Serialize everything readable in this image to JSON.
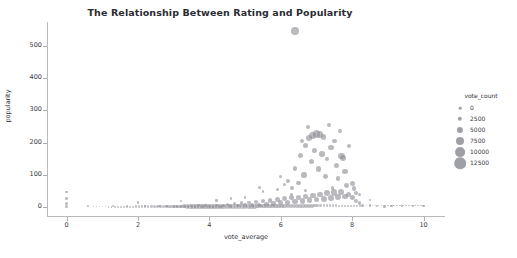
{
  "chart_data": {
    "type": "scatter",
    "title": "The Relationship Between Rating and Popularity",
    "xlabel": "vote_average",
    "ylabel": "popularity",
    "xlim": [
      -0.55,
      10.6
    ],
    "ylim": [
      -28,
      575
    ],
    "xticks": [
      0,
      2,
      4,
      6,
      8,
      10
    ],
    "yticks": [
      0,
      100,
      200,
      300,
      400,
      500
    ],
    "grid": false,
    "marker_color": "#8e8e96",
    "marker_opacity": 0.62,
    "size_legend": {
      "title": "vote_count",
      "position": "right",
      "entries": [
        {
          "label": "0",
          "value": 0,
          "px": 2.6
        },
        {
          "label": "2500",
          "value": 2500,
          "px": 4.4
        },
        {
          "label": "5000",
          "value": 5000,
          "px": 6.2
        },
        {
          "label": "7500",
          "value": 7500,
          "px": 8.0
        },
        {
          "label": "10000",
          "value": 10000,
          "px": 9.8
        },
        {
          "label": "12500",
          "value": 12500,
          "px": 11.6
        }
      ]
    },
    "points": [
      {
        "x": 6.4,
        "y": 547,
        "s": 7.5
      },
      {
        "x": 0.0,
        "y": 46,
        "s": 2.4
      },
      {
        "x": 0.0,
        "y": 27,
        "s": 2.6
      },
      {
        "x": 0.0,
        "y": 10,
        "s": 3.0
      },
      {
        "x": 0.0,
        "y": 2,
        "s": 3.4
      },
      {
        "x": 0.6,
        "y": 3,
        "s": 2.4
      },
      {
        "x": 1.3,
        "y": 2,
        "s": 2.2
      },
      {
        "x": 1.7,
        "y": 2,
        "s": 2.2
      },
      {
        "x": 2.2,
        "y": 2,
        "s": 2.2
      },
      {
        "x": 2.6,
        "y": 2,
        "s": 2.2
      },
      {
        "x": 2.8,
        "y": 2,
        "s": 2.2
      },
      {
        "x": 3.0,
        "y": 2,
        "s": 2.4
      },
      {
        "x": 3.1,
        "y": 2,
        "s": 2.4
      },
      {
        "x": 3.2,
        "y": 2,
        "s": 2.4
      },
      {
        "x": 3.3,
        "y": 2,
        "s": 2.4
      },
      {
        "x": 3.4,
        "y": 2,
        "s": 2.4
      },
      {
        "x": 3.5,
        "y": 3,
        "s": 2.6
      },
      {
        "x": 3.6,
        "y": 2,
        "s": 2.6
      },
      {
        "x": 3.7,
        "y": 4,
        "s": 2.8
      },
      {
        "x": 3.8,
        "y": 2,
        "s": 2.8
      },
      {
        "x": 3.9,
        "y": 5,
        "s": 2.8
      },
      {
        "x": 4.0,
        "y": 3,
        "s": 3.0
      },
      {
        "x": 4.1,
        "y": 2,
        "s": 2.8
      },
      {
        "x": 4.2,
        "y": 6,
        "s": 3.0
      },
      {
        "x": 4.3,
        "y": 2,
        "s": 3.0
      },
      {
        "x": 4.4,
        "y": 4,
        "s": 3.2
      },
      {
        "x": 4.5,
        "y": 8,
        "s": 3.2
      },
      {
        "x": 4.6,
        "y": 3,
        "s": 3.2
      },
      {
        "x": 4.7,
        "y": 10,
        "s": 3.4
      },
      {
        "x": 4.8,
        "y": 4,
        "s": 3.4
      },
      {
        "x": 4.9,
        "y": 12,
        "s": 3.6
      },
      {
        "x": 5.0,
        "y": 6,
        "s": 3.6
      },
      {
        "x": 5.1,
        "y": 14,
        "s": 3.8
      },
      {
        "x": 5.2,
        "y": 5,
        "s": 3.8
      },
      {
        "x": 5.3,
        "y": 16,
        "s": 4.0
      },
      {
        "x": 5.4,
        "y": 7,
        "s": 4.0
      },
      {
        "x": 5.5,
        "y": 18,
        "s": 4.2
      },
      {
        "x": 5.6,
        "y": 9,
        "s": 4.2
      },
      {
        "x": 5.7,
        "y": 20,
        "s": 4.4
      },
      {
        "x": 5.8,
        "y": 11,
        "s": 4.4
      },
      {
        "x": 5.9,
        "y": 24,
        "s": 4.6
      },
      {
        "x": 6.0,
        "y": 13,
        "s": 4.8
      },
      {
        "x": 6.1,
        "y": 26,
        "s": 4.8
      },
      {
        "x": 6.2,
        "y": 15,
        "s": 5.0
      },
      {
        "x": 6.3,
        "y": 28,
        "s": 5.0
      },
      {
        "x": 6.4,
        "y": 17,
        "s": 5.2
      },
      {
        "x": 6.5,
        "y": 30,
        "s": 5.2
      },
      {
        "x": 6.6,
        "y": 19,
        "s": 5.4
      },
      {
        "x": 6.7,
        "y": 33,
        "s": 5.4
      },
      {
        "x": 6.8,
        "y": 21,
        "s": 5.6
      },
      {
        "x": 6.9,
        "y": 36,
        "s": 5.6
      },
      {
        "x": 7.0,
        "y": 23,
        "s": 5.8
      },
      {
        "x": 7.1,
        "y": 39,
        "s": 5.8
      },
      {
        "x": 7.2,
        "y": 25,
        "s": 6.0
      },
      {
        "x": 7.3,
        "y": 42,
        "s": 6.0
      },
      {
        "x": 7.4,
        "y": 27,
        "s": 6.2
      },
      {
        "x": 7.5,
        "y": 45,
        "s": 6.2
      },
      {
        "x": 7.6,
        "y": 30,
        "s": 6.0
      },
      {
        "x": 7.7,
        "y": 48,
        "s": 6.0
      },
      {
        "x": 7.8,
        "y": 32,
        "s": 5.6
      },
      {
        "x": 7.9,
        "y": 40,
        "s": 5.2
      },
      {
        "x": 8.0,
        "y": 28,
        "s": 5.0
      },
      {
        "x": 8.1,
        "y": 18,
        "s": 4.0
      },
      {
        "x": 8.2,
        "y": 12,
        "s": 3.4
      },
      {
        "x": 8.3,
        "y": 6,
        "s": 3.0
      },
      {
        "x": 8.5,
        "y": 4,
        "s": 2.6
      },
      {
        "x": 8.7,
        "y": 3,
        "s": 2.4
      },
      {
        "x": 8.9,
        "y": 2,
        "s": 2.4
      },
      {
        "x": 9.1,
        "y": 2,
        "s": 2.2
      },
      {
        "x": 9.4,
        "y": 2,
        "s": 2.2
      },
      {
        "x": 9.7,
        "y": 2,
        "s": 2.2
      },
      {
        "x": 10.0,
        "y": 3,
        "s": 2.8
      },
      {
        "x": 5.4,
        "y": 62,
        "s": 3.0
      },
      {
        "x": 5.5,
        "y": 48,
        "s": 2.8
      },
      {
        "x": 5.9,
        "y": 55,
        "s": 3.2
      },
      {
        "x": 6.0,
        "y": 95,
        "s": 3.4
      },
      {
        "x": 6.1,
        "y": 70,
        "s": 3.6
      },
      {
        "x": 6.2,
        "y": 82,
        "s": 4.2
      },
      {
        "x": 6.3,
        "y": 58,
        "s": 4.0
      },
      {
        "x": 6.4,
        "y": 120,
        "s": 4.4
      },
      {
        "x": 6.5,
        "y": 75,
        "s": 4.6
      },
      {
        "x": 6.55,
        "y": 160,
        "s": 5.0
      },
      {
        "x": 6.6,
        "y": 205,
        "s": 4.2
      },
      {
        "x": 6.65,
        "y": 100,
        "s": 5.4
      },
      {
        "x": 6.7,
        "y": 190,
        "s": 5.0
      },
      {
        "x": 6.75,
        "y": 248,
        "s": 4.0
      },
      {
        "x": 6.8,
        "y": 215,
        "s": 6.2
      },
      {
        "x": 6.85,
        "y": 140,
        "s": 5.0
      },
      {
        "x": 6.9,
        "y": 222,
        "s": 7.0
      },
      {
        "x": 6.95,
        "y": 175,
        "s": 4.6
      },
      {
        "x": 7.0,
        "y": 228,
        "s": 7.8
      },
      {
        "x": 7.05,
        "y": 118,
        "s": 5.2
      },
      {
        "x": 7.1,
        "y": 225,
        "s": 6.6
      },
      {
        "x": 7.15,
        "y": 165,
        "s": 5.6
      },
      {
        "x": 7.2,
        "y": 218,
        "s": 5.4
      },
      {
        "x": 7.25,
        "y": 95,
        "s": 4.8
      },
      {
        "x": 7.3,
        "y": 150,
        "s": 4.4
      },
      {
        "x": 7.35,
        "y": 255,
        "s": 4.6
      },
      {
        "x": 7.4,
        "y": 185,
        "s": 5.8
      },
      {
        "x": 7.5,
        "y": 205,
        "s": 4.8
      },
      {
        "x": 7.55,
        "y": 130,
        "s": 5.0
      },
      {
        "x": 7.6,
        "y": 88,
        "s": 4.6
      },
      {
        "x": 7.65,
        "y": 235,
        "s": 4.2
      },
      {
        "x": 7.7,
        "y": 158,
        "s": 6.4
      },
      {
        "x": 7.75,
        "y": 152,
        "s": 6.0
      },
      {
        "x": 7.8,
        "y": 110,
        "s": 5.2
      },
      {
        "x": 7.85,
        "y": 68,
        "s": 4.8
      },
      {
        "x": 7.9,
        "y": 190,
        "s": 4.0
      },
      {
        "x": 8.0,
        "y": 72,
        "s": 5.0
      },
      {
        "x": 8.05,
        "y": 58,
        "s": 4.4
      },
      {
        "x": 8.1,
        "y": 45,
        "s": 4.0
      },
      {
        "x": 8.2,
        "y": 38,
        "s": 3.4
      },
      {
        "x": 8.5,
        "y": 22,
        "s": 2.8
      },
      {
        "x": 5.0,
        "y": 30,
        "s": 2.6
      },
      {
        "x": 4.6,
        "y": 26,
        "s": 2.4
      },
      {
        "x": 4.2,
        "y": 20,
        "s": 2.4
      },
      {
        "x": 3.2,
        "y": 18,
        "s": 2.2
      },
      {
        "x": 2.0,
        "y": 14,
        "s": 2.2
      },
      {
        "x": 6.3,
        "y": 40,
        "s": 3.0
      },
      {
        "x": 6.7,
        "y": 52,
        "s": 3.4
      },
      {
        "x": 7.45,
        "y": 60,
        "s": 3.8
      }
    ]
  }
}
